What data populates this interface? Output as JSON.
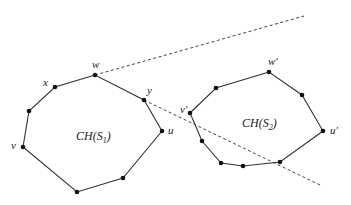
{
  "diagram": {
    "title": "",
    "hulls": [
      {
        "id": "S1",
        "label_main": "CH(S",
        "label_sub": "1",
        "label_close": ")",
        "label_pos": [
          76,
          140
        ],
        "vertices": [
          [
            95,
            75
          ],
          [
            55,
            87
          ],
          [
            29,
            111
          ],
          [
            23,
            147
          ],
          [
            77,
            192
          ],
          [
            123,
            178
          ],
          [
            162,
            131
          ],
          [
            144,
            100
          ]
        ],
        "named_vertices": [
          {
            "name": "w",
            "pos": [
              95,
              75
            ],
            "label_pos": [
              92,
              68
            ]
          },
          {
            "name": "x",
            "pos": [
              55,
              87
            ],
            "label_pos": [
              43,
              86
            ]
          },
          {
            "name": "y",
            "pos": [
              144,
              100
            ],
            "label_pos": [
              147,
              94
            ]
          },
          {
            "name": "u",
            "pos": [
              162,
              131
            ],
            "label_pos": [
              168,
              134
            ]
          },
          {
            "name": "v",
            "pos": [
              23,
              147
            ],
            "label_pos": [
              11,
              149
            ]
          }
        ]
      },
      {
        "id": "S2",
        "label_main": "CH(S",
        "label_sub": "2",
        "label_close": ")",
        "label_pos": [
          242,
          127
        ],
        "vertices": [
          [
            269,
            72
          ],
          [
            216,
            88
          ],
          [
            190,
            113
          ],
          [
            202,
            141
          ],
          [
            221,
            163
          ],
          [
            243,
            166
          ],
          [
            280,
            162
          ],
          [
            323,
            131
          ],
          [
            302,
            95
          ]
        ],
        "named_vertices": [
          {
            "name": "w'",
            "pos": [
              269,
              72
            ],
            "label_pos": [
              268,
              65
            ]
          },
          {
            "name": "v'",
            "pos": [
              190,
              113
            ],
            "label_pos": [
              180,
              113
            ]
          },
          {
            "name": "u'",
            "pos": [
              323,
              131
            ],
            "label_pos": [
              330,
              134
            ]
          }
        ]
      }
    ],
    "tangent_lines": [
      {
        "id": "upper-tangent",
        "from": [
          95,
          75
        ],
        "to": [
          304,
          16
        ]
      },
      {
        "id": "lower-tangent",
        "from": [
          144,
          100
        ],
        "to": [
          322,
          186
        ]
      }
    ],
    "colors": {
      "edge": "#333333",
      "vertex": "#111111",
      "background": "#ffffff"
    }
  }
}
